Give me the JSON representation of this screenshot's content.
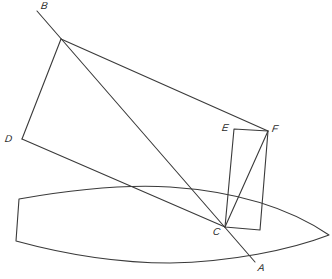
{
  "diagram": {
    "type": "geometric-construction",
    "stroke_color": "#3a3a3a",
    "background": "#ffffff",
    "points": {
      "B": {
        "label": "B",
        "x": 37,
        "y": 11
      },
      "V": {
        "x": 61,
        "y": 39
      },
      "D": {
        "label": "D",
        "x": 22,
        "y": 139
      },
      "E": {
        "label": "E",
        "x": 234,
        "y": 129
      },
      "F": {
        "label": "F",
        "x": 268,
        "y": 131
      },
      "C": {
        "label": "C",
        "x": 225,
        "y": 227
      },
      "R": {
        "x": 260,
        "y": 230
      },
      "A": {
        "label": "A",
        "x": 255,
        "y": 262
      }
    },
    "labels": {
      "B": "B",
      "D": "D",
      "E": "E",
      "F": "F",
      "C": "C",
      "A": "A"
    },
    "segments": [
      [
        "B",
        "A"
      ],
      [
        "V",
        "F"
      ],
      [
        "V",
        "D"
      ],
      [
        "D",
        "C"
      ],
      [
        "E",
        "F"
      ],
      [
        "E",
        "C"
      ],
      [
        "F",
        "R"
      ],
      [
        "C",
        "R"
      ],
      [
        "C",
        "F"
      ]
    ],
    "hull": {
      "description": "boat-hull outline (leaf shape with flat stern)",
      "stern_top": {
        "x": 19,
        "y": 199
      },
      "stern_bottom": {
        "x": 16,
        "y": 241
      },
      "bow": {
        "x": 329,
        "y": 235
      }
    }
  }
}
